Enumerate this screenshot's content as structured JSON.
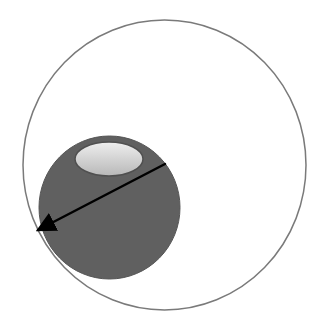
{
  "diagram": {
    "colors": {
      "background": "#ffffff",
      "outer_circle_stroke": "#7a7a7a",
      "sphere_fill": "#606060",
      "sphere_edge": "#555555",
      "highlight_light": "#eeeeee",
      "highlight_dark": "#b8b8b8",
      "arrow": "#000000"
    },
    "outer_circle": {
      "cx": 164.5,
      "cy": 165,
      "rx": 141.5,
      "ry": 145
    },
    "sphere": {
      "cx": 109.5,
      "cy": 207.5,
      "rx": 70.5,
      "ry": 71.5
    },
    "highlight": {
      "cx": 109,
      "cy": 159,
      "rx": 34,
      "ry": 17
    },
    "arrow": {
      "x1": 165,
      "y1": 164,
      "x2": 38,
      "y2": 230
    }
  }
}
